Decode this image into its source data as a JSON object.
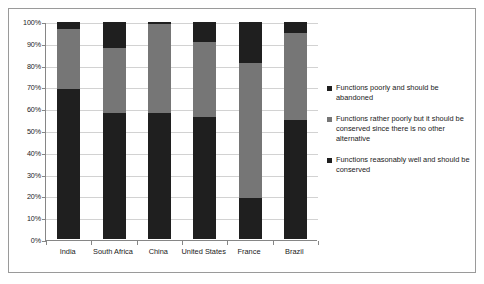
{
  "chart_data": {
    "type": "bar",
    "subtype": "stacked-100-percent",
    "title": "",
    "xlabel": "",
    "ylabel": "",
    "ylim": [
      0,
      100
    ],
    "ytick_labels": [
      "100%",
      "90%",
      "80%",
      "70%",
      "60%",
      "50%",
      "40%",
      "30%",
      "20%",
      "10%",
      "0%"
    ],
    "ytick_values": [
      100,
      90,
      80,
      70,
      60,
      50,
      40,
      30,
      20,
      10,
      0
    ],
    "grid": true,
    "legend_position": "right",
    "categories": [
      "India",
      "South Africa",
      "China",
      "United States",
      "France",
      "Brazil"
    ],
    "series": [
      {
        "name": "Functions reasonably well and should be conserved",
        "color": "#1f1f1f",
        "values": [
          69,
          58,
          58,
          56,
          19,
          55
        ]
      },
      {
        "name": "Functions rather poorly but it should be conserved since there is no other alternative",
        "color": "#767676",
        "values": [
          28,
          30,
          41,
          35,
          62,
          40
        ]
      },
      {
        "name": "Functions poorly and should be abandoned",
        "color": "#1f1f1f",
        "values": [
          3,
          12,
          1,
          9,
          19,
          5
        ]
      }
    ]
  },
  "legend": {
    "items": [
      {
        "label": "Functions poorly and should be abandoned",
        "color": "#1f1f1f"
      },
      {
        "label": "Functions rather poorly but it should be conserved since there is no other alternative",
        "color": "#767676"
      },
      {
        "label": "Functions reasonably well and should be conserved",
        "color": "#1f1f1f"
      }
    ]
  },
  "colors": {
    "series_dark": "#1f1f1f",
    "series_gray": "#767676",
    "gridline": "#d2d2d2",
    "axis": "#868686",
    "frame": "#9a9a9a",
    "background": "#ffffff",
    "text": "#1a1a1a"
  }
}
